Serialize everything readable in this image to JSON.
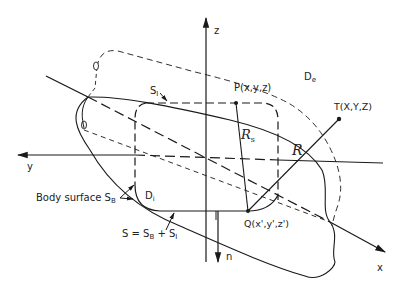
{
  "diagram": {
    "axes": {
      "x": "x",
      "y": "y",
      "z": "z",
      "normal": "n"
    },
    "points": {
      "P": "P(x,y,z)",
      "Q": "Q(x',y',z')",
      "T": "T(X,Y,Z)"
    },
    "distances": {
      "R_s": "R",
      "R_s_sub": "s",
      "R": "R"
    },
    "regions": {
      "exterior": "D",
      "exterior_sub": "e",
      "interior": "D",
      "interior_sub": "i"
    },
    "surfaces": {
      "S_I": "S",
      "S_I_sub": "I",
      "body_surface_label": "Body surface S",
      "body_surface_sub": "B",
      "total_surface_eq": "S = S",
      "total_surface_sub1": "B",
      "total_surface_plus": " + S",
      "total_surface_sub2": "I"
    },
    "colors": {
      "line": "#1a1a1a",
      "background": "#ffffff"
    }
  }
}
